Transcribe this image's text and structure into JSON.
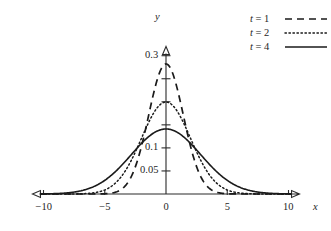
{
  "chart_data": {
    "type": "line",
    "title": "",
    "xlabel": "x",
    "ylabel": "y",
    "xlim": [
      -10.9,
      10.9
    ],
    "ylim": [
      0,
      0.32
    ],
    "grid": false,
    "legend_position": "top-right",
    "x_ticks": [
      {
        "value": -10,
        "label": "−10"
      },
      {
        "value": -5,
        "label": "−5"
      },
      {
        "value": 0,
        "label": "0"
      },
      {
        "value": 5,
        "label": "5"
      },
      {
        "value": 10,
        "label": "10"
      }
    ],
    "y_ticks": [
      {
        "value": 0.05,
        "label": "0.05"
      },
      {
        "value": 0.1,
        "label": "0.1"
      },
      {
        "value": 0.15,
        "label": ""
      },
      {
        "value": 0.2,
        "label": ""
      },
      {
        "value": 0.25,
        "label": ""
      },
      {
        "value": 0.3,
        "label": "0.3"
      }
    ],
    "series": [
      {
        "name": "t = 1",
        "t": 1,
        "style": "dashed",
        "color": "#1a1a1a",
        "peak": 0.2821,
        "formula": "gaussian",
        "points": [
          [
            -10.9,
            0.0
          ],
          [
            -10.0,
            0.0
          ],
          [
            -9.0,
            0.0
          ],
          [
            -8.0,
            0.0
          ],
          [
            -7.0,
            0.0
          ],
          [
            -6.0,
            0.0
          ],
          [
            -5.5,
            0.0001
          ],
          [
            -5.0,
            0.0005
          ],
          [
            -4.5,
            0.0017
          ],
          [
            -4.0,
            0.0052
          ],
          [
            -3.75,
            0.0086
          ],
          [
            -3.5,
            0.0137
          ],
          [
            -3.25,
            0.0211
          ],
          [
            -3.0,
            0.0313
          ],
          [
            -2.75,
            0.0448
          ],
          [
            -2.5,
            0.0618
          ],
          [
            -2.25,
            0.0822
          ],
          [
            -2.0,
            0.1038
          ],
          [
            -1.75,
            0.1284
          ],
          [
            -1.5,
            0.154
          ],
          [
            -1.25,
            0.1788
          ],
          [
            -1.0,
            0.2008
          ],
          [
            -0.75,
            0.2186
          ],
          [
            -0.5,
            0.2307
          ],
          [
            -0.25,
            0.2378
          ],
          [
            0.0,
            0.2821
          ],
          [
            0.25,
            0.2378
          ],
          [
            0.5,
            0.2307
          ],
          [
            0.75,
            0.2186
          ],
          [
            1.0,
            0.2008
          ],
          [
            1.25,
            0.1788
          ],
          [
            1.5,
            0.154
          ],
          [
            1.75,
            0.1284
          ],
          [
            2.0,
            0.1038
          ],
          [
            2.25,
            0.0822
          ],
          [
            2.5,
            0.0618
          ],
          [
            2.75,
            0.0448
          ],
          [
            3.0,
            0.0313
          ],
          [
            3.25,
            0.0211
          ],
          [
            3.5,
            0.0137
          ],
          [
            3.75,
            0.0086
          ],
          [
            4.0,
            0.0052
          ],
          [
            4.5,
            0.0017
          ],
          [
            5.0,
            0.0005
          ],
          [
            5.5,
            0.0001
          ],
          [
            6.0,
            0.0
          ],
          [
            7.0,
            0.0
          ],
          [
            8.0,
            0.0
          ],
          [
            9.0,
            0.0
          ],
          [
            10.0,
            0.0
          ],
          [
            10.9,
            0.0
          ]
        ]
      },
      {
        "name": "t = 2",
        "t": 2,
        "style": "dotted",
        "color": "#1a1a1a",
        "peak": 0.1995,
        "formula": "gaussian",
        "points": [
          [
            -10.9,
            0.0
          ],
          [
            -10.0,
            0.0
          ],
          [
            -9.0,
            0.0
          ],
          [
            -8.0,
            0.0001
          ],
          [
            -7.0,
            0.0005
          ],
          [
            -6.5,
            0.0012
          ],
          [
            -6.0,
            0.0022
          ],
          [
            -5.5,
            0.0043
          ],
          [
            -5.0,
            0.0078
          ],
          [
            -4.5,
            0.0131
          ],
          [
            -4.0,
            0.0216
          ],
          [
            -3.5,
            0.0333
          ],
          [
            -3.0,
            0.0483
          ],
          [
            -2.75,
            0.0572
          ],
          [
            -2.5,
            0.0666
          ],
          [
            -2.25,
            0.0765
          ],
          [
            -2.0,
            0.0872
          ],
          [
            -1.75,
            0.0977
          ],
          [
            -1.5,
            0.1079
          ],
          [
            -1.25,
            0.1175
          ],
          [
            -1.0,
            0.1268
          ],
          [
            -0.75,
            0.1347
          ],
          [
            -0.5,
            0.1408
          ],
          [
            -0.25,
            0.145
          ],
          [
            0.0,
            0.1995
          ],
          [
            0.25,
            0.145
          ],
          [
            0.5,
            0.1408
          ],
          [
            0.75,
            0.1347
          ],
          [
            1.0,
            0.1268
          ],
          [
            1.25,
            0.1175
          ],
          [
            1.5,
            0.1079
          ],
          [
            1.75,
            0.0977
          ],
          [
            2.0,
            0.0872
          ],
          [
            2.25,
            0.0765
          ],
          [
            2.5,
            0.0666
          ],
          [
            2.75,
            0.0572
          ],
          [
            3.0,
            0.0483
          ],
          [
            3.5,
            0.0333
          ],
          [
            4.0,
            0.0216
          ],
          [
            4.5,
            0.0131
          ],
          [
            5.0,
            0.0078
          ],
          [
            5.5,
            0.0043
          ],
          [
            6.0,
            0.0022
          ],
          [
            6.5,
            0.0012
          ],
          [
            7.0,
            0.0005
          ],
          [
            8.0,
            0.0001
          ],
          [
            9.0,
            0.0
          ],
          [
            10.0,
            0.0
          ],
          [
            10.9,
            0.0
          ]
        ]
      },
      {
        "name": "t = 4",
        "t": 4,
        "style": "solid",
        "color": "#1a1a1a",
        "peak": 0.141,
        "formula": "gaussian",
        "points": [
          [
            -10.9,
            0.0007
          ],
          [
            -10.0,
            0.0015
          ],
          [
            -9.5,
            0.0023
          ],
          [
            -9.0,
            0.0033
          ],
          [
            -8.5,
            0.0046
          ],
          [
            -8.0,
            0.0064
          ],
          [
            -7.5,
            0.0087
          ],
          [
            -7.0,
            0.0116
          ],
          [
            -6.5,
            0.0152
          ],
          [
            -6.0,
            0.0195
          ],
          [
            -5.5,
            0.0245
          ],
          [
            -5.0,
            0.0303
          ],
          [
            -4.5,
            0.0368
          ],
          [
            -4.0,
            0.0438
          ],
          [
            -3.5,
            0.0512
          ],
          [
            -3.0,
            0.0587
          ],
          [
            -2.5,
            0.066
          ],
          [
            -2.0,
            0.0729
          ],
          [
            -1.5,
            0.079
          ],
          [
            -1.0,
            0.084
          ],
          [
            -0.5,
            0.0876
          ],
          [
            -0.25,
            0.0888
          ],
          [
            0.0,
            0.141
          ],
          [
            0.25,
            0.0888
          ],
          [
            0.5,
            0.0876
          ],
          [
            1.0,
            0.084
          ],
          [
            1.5,
            0.079
          ],
          [
            2.0,
            0.0729
          ],
          [
            2.5,
            0.066
          ],
          [
            3.0,
            0.0587
          ],
          [
            3.5,
            0.0512
          ],
          [
            4.0,
            0.0438
          ],
          [
            4.5,
            0.0368
          ],
          [
            5.0,
            0.0303
          ],
          [
            5.5,
            0.0245
          ],
          [
            6.0,
            0.0195
          ],
          [
            6.5,
            0.0152
          ],
          [
            7.0,
            0.0116
          ],
          [
            7.5,
            0.0087
          ],
          [
            8.0,
            0.0064
          ],
          [
            8.5,
            0.0046
          ],
          [
            9.0,
            0.0033
          ],
          [
            9.5,
            0.0023
          ],
          [
            10.0,
            0.0015
          ],
          [
            10.9,
            0.0007
          ]
        ]
      }
    ]
  },
  "legend": {
    "entries": [
      {
        "label_var": "t",
        "label_eq": " = ",
        "label_val": "1",
        "style": "dashed"
      },
      {
        "label_var": "t",
        "label_eq": " = ",
        "label_val": "2",
        "style": "dotted"
      },
      {
        "label_var": "t",
        "label_eq": " = ",
        "label_val": "4",
        "style": "solid"
      }
    ]
  },
  "axis_labels": {
    "x": "x",
    "y": "y"
  }
}
